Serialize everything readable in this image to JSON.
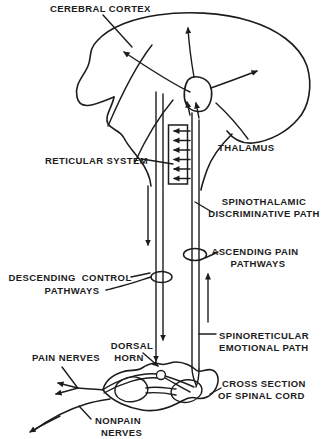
{
  "diagram": {
    "colors": {
      "ink": "#1c1c1c",
      "background": "#ffffff"
    },
    "labels": {
      "cerebral_cortex": "CEREBRAL CORTEX",
      "reticular_system": "RETICULAR SYSTEM",
      "thalamus": "THALAMUS",
      "spinothalamic_line1": "SPINOTHALAMIC",
      "spinothalamic_line2": "DISCRIMINATIVE PATH",
      "ascending_line1": "ASCENDING PAIN",
      "ascending_line2": "PATHWAYS",
      "descending_line1": "DESCENDING  CONTROL",
      "descending_line2": "PATHWAYS",
      "spinoreticular_line1": "SPINORETICULAR",
      "spinoreticular_line2": "EMOTIONAL PATH",
      "dorsal_horn_line1": "DORSAL",
      "dorsal_horn_line2": "HORN",
      "pain_nerves": "PAIN NERVES",
      "cross_section_line1": "CROSS SECTION",
      "cross_section_line2": "OF SPINAL CORD",
      "nonpain_line1": "NONPAIN",
      "nonpain_line2": "NERVES"
    }
  }
}
